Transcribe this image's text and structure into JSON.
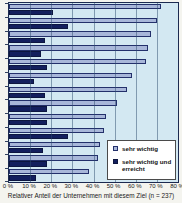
{
  "caption": "Relativer Anteil der Unternehmen mit diesem Ziel (n = 237)",
  "colors": {
    "plot_background": "#d3e8f2",
    "plot_border": "#1c2a50",
    "gridline": "#3c5a78",
    "bar_light_fill": "#a8b7d9",
    "bar_light_border": "#23306b",
    "bar_dark_fill": "#131f5e",
    "legend_background": "#ffffff",
    "page_background": "#f4f4ef"
  },
  "legend": {
    "items": [
      {
        "label": "sehr wichtig",
        "swatch": "light"
      },
      {
        "label": "sehr wichtig und erreicht",
        "swatch": "dark"
      }
    ]
  },
  "chart_data": {
    "type": "bar",
    "orientation": "horizontal",
    "title": "",
    "xlabel": "Relativer Anteil der Unternehmen mit diesem Ziel (n = 237)",
    "ylabel": "",
    "xlim": [
      0,
      80
    ],
    "grid": true,
    "legend_position": "inside-bottom-right",
    "x_tick_labels": [
      "0 %",
      "10 %",
      "20 %",
      "30 %",
      "40 %",
      "50 %",
      "60 %",
      "70 %",
      "80 %"
    ],
    "categories_visible": false,
    "series": [
      {
        "name": "sehr wichtig",
        "color": "#a8b7d9",
        "values": [
          72,
          70,
          67,
          66,
          65,
          58,
          56,
          51,
          46,
          45,
          43,
          42,
          38
        ]
      },
      {
        "name": "sehr wichtig und erreicht",
        "color": "#131f5e",
        "values": [
          21,
          28,
          17,
          15,
          18,
          12,
          17,
          18,
          18,
          28,
          16,
          18,
          13
        ]
      }
    ]
  }
}
